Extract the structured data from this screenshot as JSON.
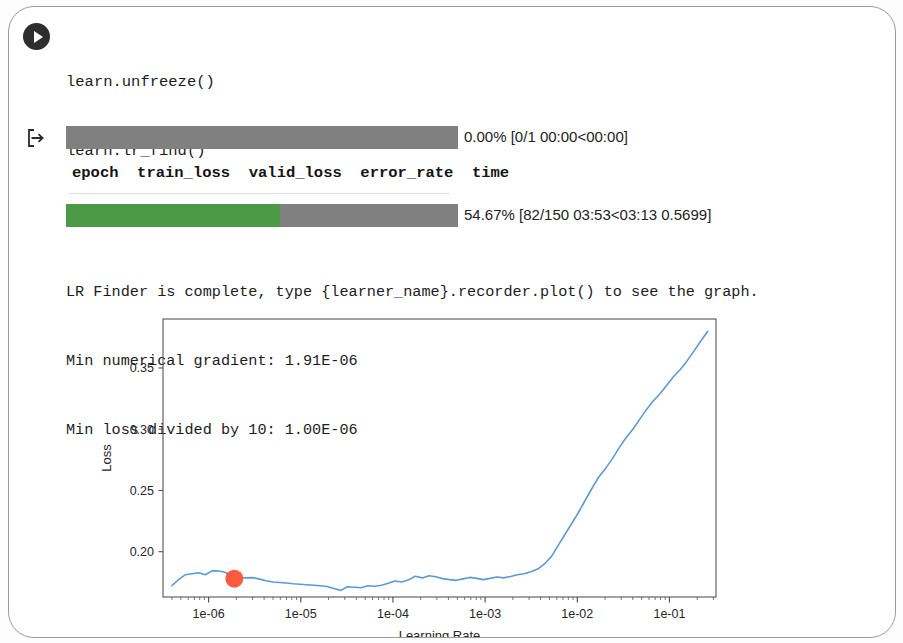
{
  "cell": {
    "run_icon": "play-icon",
    "output_prompt_icon": "output-arrow-icon",
    "code_lines": [
      "learn.unfreeze()",
      "learn.lr_find()"
    ],
    "code_line_3_prefix": "learn.recorder.plot(suggestion=",
    "code_line_3_keyword": "True",
    "code_line_3_suffix": ")"
  },
  "output": {
    "progress_bars": [
      {
        "name": "epoch-progress",
        "percent": 0.0,
        "label": "0.00% [0/1 00:00<00:00]",
        "fill_color": "#4c9a45",
        "track_color": "#808080"
      },
      {
        "name": "batch-progress",
        "percent": 54.67,
        "label": "54.67% [82/150 03:53<03:13 0.5699]",
        "fill_color": "#4c9a45",
        "track_color": "#808080"
      }
    ],
    "table_headers": [
      "epoch",
      "train_loss",
      "valid_loss",
      "error_rate",
      "time"
    ],
    "table_header_line": "epoch  train_loss  valid_loss  error_rate  time",
    "messages": [
      "LR Finder is complete, type {learner_name}.recorder.plot() to see the graph.",
      "Min numerical gradient: 1.91E-06",
      "Min loss divided by 10: 1.00E-06"
    ]
  },
  "chart_data": {
    "type": "line",
    "title": "",
    "xlabel": "Learning Rate",
    "ylabel": "Loss",
    "xscale": "log",
    "yscale": "linear",
    "grid": false,
    "legend": null,
    "xlim": [
      3.2e-07,
      0.32
    ],
    "ylim": [
      0.163,
      0.39
    ],
    "xticks": [
      1e-06,
      1e-05,
      0.0001,
      0.001,
      0.01,
      0.1
    ],
    "xtick_labels": [
      "1e-06",
      "1e-05",
      "1e-04",
      "1e-03",
      "1e-02",
      "1e-01"
    ],
    "yticks": [
      0.2,
      0.25,
      0.3,
      0.35
    ],
    "ytick_labels": [
      "0.20",
      "0.25",
      "0.30",
      "0.35"
    ],
    "line_color": "#5b9bd5",
    "marker": {
      "name": "suggested-lr-marker",
      "x": 1.9e-06,
      "y": 0.178,
      "color": "#fb5a3c",
      "size": 9
    },
    "series": [
      {
        "name": "loss",
        "x": [
          3.98e-07,
          4.7e-07,
          5.6e-07,
          6.6e-07,
          7.8e-07,
          9.2e-07,
          1.1e-06,
          1.3e-06,
          1.5e-06,
          1.8e-06,
          2.1e-06,
          2.5e-06,
          3e-06,
          3.5e-06,
          4.2e-06,
          5e-06,
          5.9e-06,
          7e-06,
          8.3e-06,
          9.8e-06,
          1.16e-05,
          1.38e-05,
          1.63e-05,
          1.93e-05,
          2.29e-05,
          2.71e-05,
          3.21e-05,
          3.81e-05,
          4.51e-05,
          5.35e-05,
          6.34e-05,
          7.51e-05,
          8.9e-05,
          0.000105,
          0.000125,
          0.000148,
          0.000175,
          0.000208,
          0.000246,
          0.000292,
          0.000346,
          0.00041,
          0.000486,
          0.000575,
          0.000682,
          0.000808,
          0.000957,
          0.00113,
          0.00134,
          0.00159,
          0.00189,
          0.00224,
          0.00265,
          0.00314,
          0.00372,
          0.00441,
          0.00523,
          0.00619,
          0.00734,
          0.0087,
          0.0103,
          0.0122,
          0.0145,
          0.0171,
          0.0203,
          0.0241,
          0.0285,
          0.0338,
          0.0401,
          0.0475,
          0.0562,
          0.0667,
          0.079,
          0.0936,
          0.111,
          0.132,
          0.156,
          0.185,
          0.219,
          0.26
        ],
        "y": [
          0.1722,
          0.177,
          0.1812,
          0.182,
          0.1828,
          0.1812,
          0.1845,
          0.1842,
          0.1832,
          0.18,
          0.1782,
          0.1786,
          0.1788,
          0.1778,
          0.1763,
          0.1752,
          0.1748,
          0.1744,
          0.1738,
          0.1734,
          0.173,
          0.1726,
          0.1722,
          0.1716,
          0.17,
          0.1684,
          0.1714,
          0.171,
          0.1706,
          0.1722,
          0.1718,
          0.1726,
          0.1742,
          0.176,
          0.1752,
          0.177,
          0.18,
          0.1786,
          0.1804,
          0.1796,
          0.178,
          0.1772,
          0.1766,
          0.1778,
          0.179,
          0.1782,
          0.1772,
          0.1782,
          0.1794,
          0.1786,
          0.1798,
          0.1812,
          0.182,
          0.1836,
          0.1858,
          0.19,
          0.196,
          0.205,
          0.214,
          0.223,
          0.232,
          0.242,
          0.252,
          0.261,
          0.268,
          0.276,
          0.285,
          0.293,
          0.3,
          0.308,
          0.316,
          0.323,
          0.329,
          0.336,
          0.343,
          0.349,
          0.356,
          0.364,
          0.372,
          0.38
        ]
      }
    ]
  }
}
